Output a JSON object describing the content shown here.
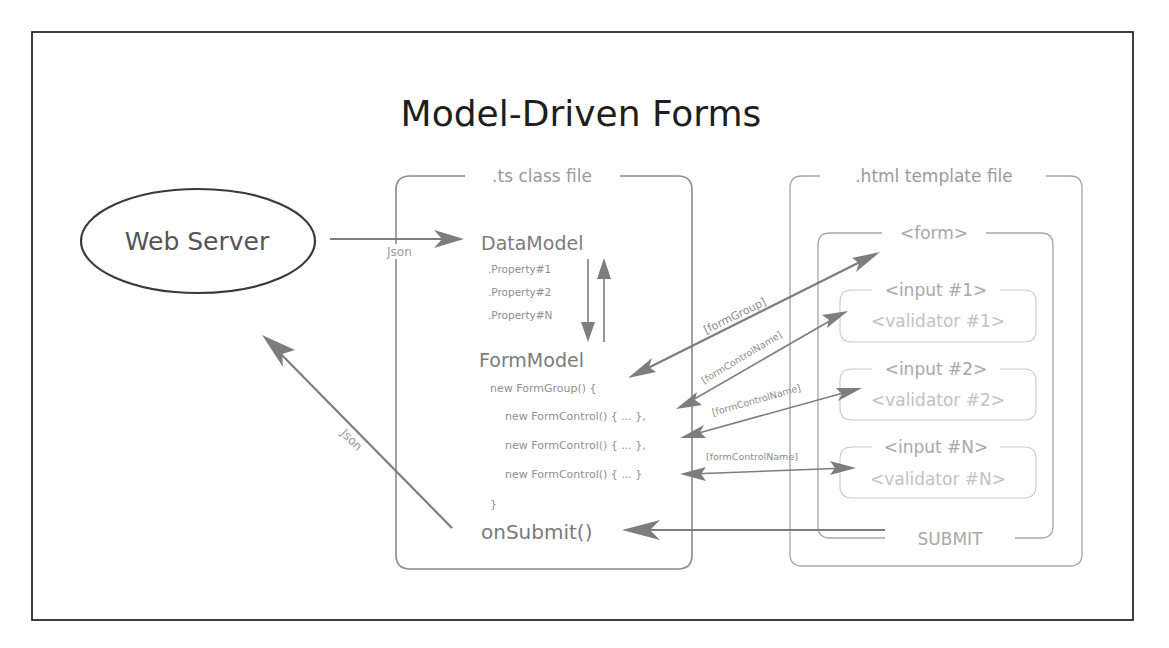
{
  "title": "Model-Driven Forms",
  "web_server": {
    "label": "Web Server"
  },
  "ts_file": {
    "label": ".ts class file",
    "data_model": {
      "label": "DataModel",
      "properties": [
        ".Property#1",
        ".Property#2",
        ".Property#N"
      ]
    },
    "form_model": {
      "label": "FormModel",
      "code_lines": [
        "new FormGroup() {",
        "new FormControl() { ... },",
        "new FormControl() { ... },",
        "new FormControl() { ... }",
        "}"
      ]
    },
    "submit_fn": "onSubmit()"
  },
  "html_file": {
    "label": ".html template file",
    "form": {
      "label": "<form>",
      "inputs": [
        {
          "input": "<input #1>",
          "validator": "<validator #1>"
        },
        {
          "input": "<input #2>",
          "validator": "<validator #2>"
        },
        {
          "input": "<input #N>",
          "validator": "<validator #N>"
        }
      ],
      "submit": "SUBMIT"
    }
  },
  "connections": {
    "json_in": "Json",
    "json_out": "Json",
    "form_group": "[formGroup]",
    "form_control_1": "[formControlName]",
    "form_control_2": "[formControlName]",
    "form_control_n": "[formControlName]"
  },
  "colors": {
    "frame": "#2a2a2a",
    "arrow": "#7d7d7d",
    "box": "#8a8a8a",
    "faint_text": "#c2c2c2"
  }
}
